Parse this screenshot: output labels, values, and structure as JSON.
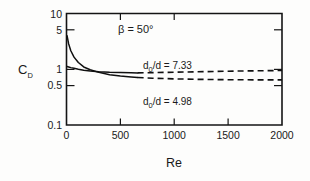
{
  "chart_data": {
    "type": "line",
    "title": "",
    "xlabel": "Re",
    "ylabel": "C_D",
    "ylabel_base": "C",
    "ylabel_sub": "D",
    "xlim": [
      0,
      2000
    ],
    "ylim": [
      0.1,
      10
    ],
    "yscale": "log",
    "xscale": "linear",
    "grid": false,
    "legend_position": "inline-annotation",
    "xticks": [
      0,
      500,
      1000,
      1500,
      2000
    ],
    "xtick_labels": [
      "0",
      "500",
      "1000",
      "1500",
      "2000"
    ],
    "yticks": [
      10,
      5,
      1,
      0.5,
      0.1
    ],
    "ytick_labels": [
      "10",
      "5",
      "1",
      "0.5",
      "0.1"
    ],
    "annotations": [
      {
        "name": "beta-annotation",
        "text": "β = 50°",
        "x": 780,
        "y": 4.6
      }
    ],
    "series": [
      {
        "name": "d0/d = 7.33",
        "label_base": "d",
        "label_sub": "0",
        "label_rest": "/d = 7.33",
        "style_solid_then_dashed": true,
        "solid_dashed_break_x": 660,
        "x": [
          5,
          20,
          40,
          70,
          110,
          160,
          220,
          300,
          400,
          500,
          600,
          660,
          800,
          1000,
          1200,
          1400,
          1600,
          1800,
          2000
        ],
        "y": [
          1.12,
          1.1,
          1.07,
          1.04,
          1.0,
          0.96,
          0.93,
          0.9,
          0.88,
          0.87,
          0.865,
          0.86,
          0.87,
          0.885,
          0.9,
          0.915,
          0.93,
          0.94,
          0.95
        ]
      },
      {
        "name": "d0/d = 4.98",
        "label_base": "d",
        "label_sub": "0",
        "label_rest": "/d = 4.98",
        "style_solid_then_dashed": true,
        "solid_dashed_break_x": 660,
        "x": [
          5,
          20,
          40,
          70,
          110,
          160,
          220,
          300,
          400,
          500,
          600,
          660,
          800,
          1000,
          1200,
          1400,
          1600,
          1800,
          2000
        ],
        "y": [
          4.0,
          2.85,
          2.15,
          1.65,
          1.32,
          1.1,
          0.98,
          0.88,
          0.8,
          0.755,
          0.725,
          0.71,
          0.69,
          0.672,
          0.66,
          0.652,
          0.648,
          0.645,
          0.645
        ]
      }
    ]
  },
  "figure": {
    "background_color": "#fdfdfc",
    "axis_color": "#141414",
    "curve_color": "#101010"
  }
}
